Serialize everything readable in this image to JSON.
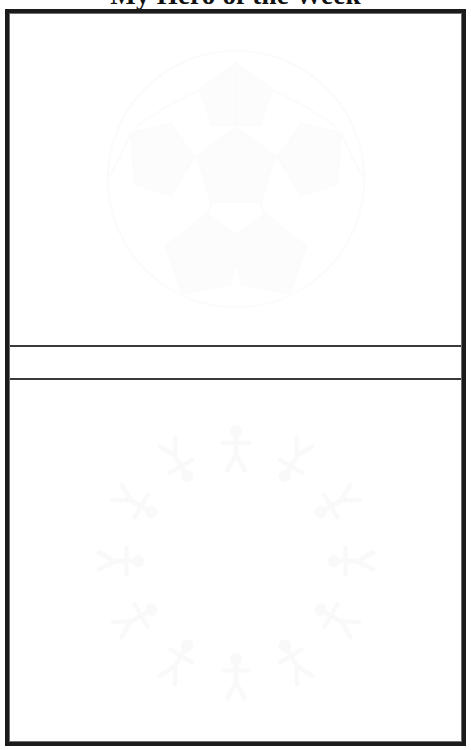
{
  "document": {
    "title": "My Hero of the Week",
    "type": "printable-worksheet",
    "page_background": "#ffffff",
    "frame_color": "#1b1b1b",
    "divider_color": "#3a3a3a"
  },
  "panels": [
    {
      "id": "drawing-panel",
      "name": "top-drawing-area",
      "label": "",
      "watermark": {
        "name": "soccer-ball-watermark",
        "description": "soccer ball",
        "color": "#e9e9ec",
        "opacity": 0.055
      }
    },
    {
      "id": "caption-band",
      "name": "caption-writing-band",
      "label": "",
      "watermark": null
    },
    {
      "id": "writing-panel",
      "name": "bottom-writing-area",
      "label": "",
      "watermark": {
        "name": "people-circle-watermark",
        "description": "ring of stick figures holding hands",
        "color": "#e4e4e8",
        "opacity": 0.085,
        "figure_count": 12
      }
    }
  ]
}
